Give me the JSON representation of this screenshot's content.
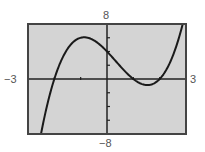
{
  "chart_data": {
    "type": "line",
    "title": "",
    "xlabel": "",
    "ylabel": "",
    "xlim": [
      -3,
      3
    ],
    "ylim": [
      -8,
      8
    ],
    "x_tick_step": 1,
    "y_tick_step": 2,
    "grid": false,
    "window_labels": {
      "xmin": "−3",
      "xmax": "3",
      "ymin": "−8",
      "ymax": "8"
    },
    "series": [
      {
        "name": "f(x) = x^3 - x^2 - 4x + 4",
        "x": [
          -2.5,
          -2.25,
          -2.0,
          -1.75,
          -1.5,
          -1.25,
          -1.0,
          -0.75,
          -0.5,
          -0.25,
          0.0,
          0.25,
          0.5,
          0.75,
          1.0,
          1.25,
          1.5,
          1.75,
          2.0,
          2.25,
          2.5,
          2.75,
          2.9
        ],
        "y": [
          -7.875,
          -3.703,
          0.0,
          2.703,
          4.375,
          5.234,
          6.0,
          5.297,
          4.875,
          4.859,
          4.0,
          2.953,
          1.875,
          1.859,
          0.0,
          -0.672,
          -0.875,
          -0.641,
          0.0,
          0.953,
          2.625,
          4.859,
          6.519
        ]
      }
    ],
    "key_points": {
      "roots": [
        -2,
        1,
        2
      ],
      "y_intercept": 4,
      "local_max": {
        "x": -1.0,
        "y": 5.5
      },
      "local_min": {
        "x": 1.5,
        "y": -0.8
      }
    }
  },
  "labels": {
    "ymax": "8",
    "ymin": "−8",
    "xmin": "−3",
    "xmax": "3"
  },
  "colors": {
    "plot_background": "#d4d4d4",
    "frame": "#444444",
    "axes": "#222222",
    "curve": "#1a1a1a",
    "label_text": "#555555"
  }
}
